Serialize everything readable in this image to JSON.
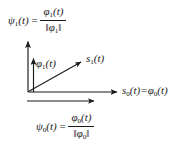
{
  "figure": {
    "background_color": "#ffffff",
    "stroke_color": "#1a1a1a"
  },
  "equations": {
    "top": {
      "lhs": "ψ₁(t)",
      "lhs_symbol": "ψ",
      "lhs_sub": "1",
      "lhs_arg": "(t)",
      "relation": "=",
      "numerator_symbol": "φ",
      "numerator_sub": "1",
      "numerator_arg": "(t)",
      "denominator": "‖ φ₁ ‖",
      "denominator_open": "‖",
      "denominator_symbol": "φ",
      "denominator_sub": "1",
      "denominator_close": "‖",
      "full_text": "ψ₁(t) = φ₁(t) / ‖φ₁‖"
    },
    "bottom": {
      "lhs_symbol": "ψ",
      "lhs_sub": "0",
      "lhs_arg": "(t)",
      "relation": "=",
      "numerator_symbol": "φ",
      "numerator_sub": "0",
      "numerator_arg": "(t)",
      "denominator_open": "‖",
      "denominator_symbol": "φ",
      "denominator_sub": "0",
      "denominator_close": "‖",
      "full_text": "ψ₀(t) = φ₀(t) / ‖φ₀‖"
    }
  },
  "labels": {
    "phi1": {
      "symbol": "φ",
      "sub": "1",
      "arg": "(t)",
      "full_text": "φ₁(t)"
    },
    "s1": {
      "symbol": "s",
      "sub": "1",
      "arg": "(t)",
      "full_text": "s₁(t)"
    },
    "s0_axis": {
      "symbol": "s",
      "sub": "0",
      "arg": "(t)",
      "relation": "=",
      "symbol2": "φ",
      "sub2": "0",
      "arg2": "(t)",
      "full_text": "s₀(t) = φ₀(t)"
    }
  },
  "vectors": {
    "vertical_axis": {
      "from": [
        28,
        92
      ],
      "to": [
        28,
        40
      ],
      "name": "vertical-axis-arrow"
    },
    "horizontal_axis": {
      "from": [
        28,
        92
      ],
      "to": [
        119,
        92
      ],
      "name": "horizontal-axis-arrow"
    },
    "phi1_vector": {
      "from": [
        28,
        92
      ],
      "to": [
        34,
        57
      ],
      "name": "phi1-vector-arrow"
    },
    "s1_vector": {
      "from": [
        28,
        92
      ],
      "to": [
        83,
        61
      ],
      "name": "s1-vector-arrow"
    },
    "psi0_vector": {
      "from": [
        27,
        101
      ],
      "to": [
        96,
        101
      ],
      "name": "psi0-vector-arrow"
    }
  }
}
